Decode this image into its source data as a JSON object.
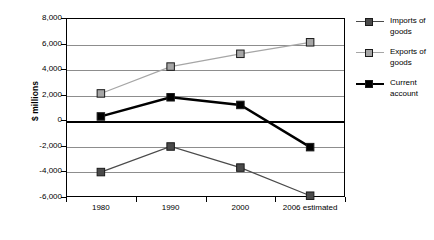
{
  "chart_data": {
    "type": "line",
    "title": "",
    "xlabel": "",
    "ylabel": "$ millions",
    "categories": [
      "1980",
      "1990",
      "2000",
      "2006 estimated"
    ],
    "ylim": [
      -6000,
      8000
    ],
    "ytick_step": 2000,
    "yticks": [
      "8,000",
      "6,000",
      "4,000",
      "2,000",
      "0",
      "-2,000",
      "-4,000",
      "-6,000"
    ],
    "ytick_values": [
      8000,
      6000,
      4000,
      2000,
      0,
      -2000,
      -4000,
      -6000
    ],
    "grid": true,
    "legend_position": "right",
    "series": [
      {
        "name": "Imports of goods",
        "legend_label_line1": "Imports of",
        "legend_label_line2": "goods",
        "color": "#4a4a4a",
        "line_width": 1.2,
        "values": [
          -4050,
          -2050,
          -3700,
          -5900
        ]
      },
      {
        "name": "Exports of goods",
        "legend_label_line1": "Exports of",
        "legend_label_line2": "goods",
        "color": "#a6a6a6",
        "line_width": 1.2,
        "values": [
          2100,
          4200,
          5200,
          6100
        ]
      },
      {
        "name": "Current account",
        "legend_label_line1": "Current",
        "legend_label_line2": "account",
        "color": "#000000",
        "line_width": 2.4,
        "values": [
          300,
          1800,
          1200,
          -2100
        ]
      }
    ]
  },
  "axis": {
    "y_title": "$ millions"
  },
  "plot": {
    "left": 66,
    "top": 18,
    "width": 279,
    "height": 179
  }
}
